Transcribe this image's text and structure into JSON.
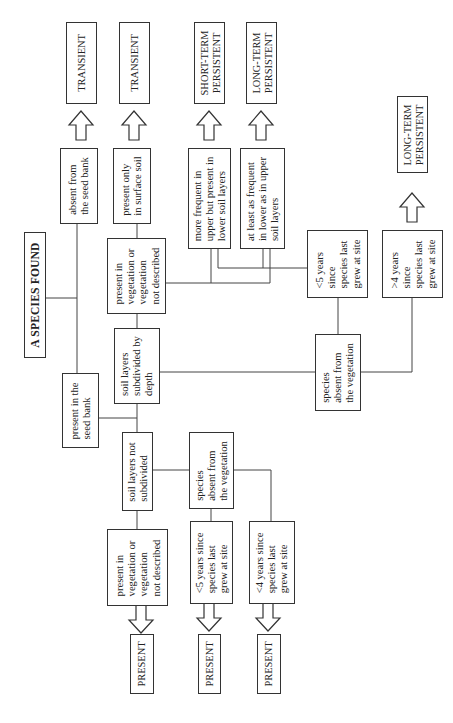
{
  "title": "A SPECIES FOUND",
  "nodes": {
    "absent_seed_bank": "absent from\nthe seed bank",
    "present_seed_bank": "present in the\nseed bank",
    "present_surface_soil": "present only\nin surface soil",
    "present_in_vegetation_subdivided": "present in\nvegetation or\nvegetation\nnot described",
    "soil_subdivided": "soil layers\nsubdivided by\ndepth",
    "soil_not_subdivided": "soil layers not\nsubdivided",
    "present_in_vegetation_not_subdivided": "present in\nvegetation or\nvegetation\nnot described",
    "more_frequent_upper": "more frequent in\nupper but present in\nlower soil layers",
    "at_least_as_frequent_lower": "at least as frequent\nin lower as in upper\nsoil layers",
    "species_absent_vegetation_subdivided": "species\nabsent from\nthe vegetation",
    "lt5_years_subdivided": "<5 years\nsince\nspecies last\ngrew at site",
    "gt4_years_subdivided": ">4 years\nsince\nspecies last\ngrew at site",
    "species_absent_vegetation_not_subdivided": "species\nabsent from\nthe vegetation",
    "lt5_years_not_subdivided": "<5 years since\nspecies last\ngrew at site",
    "lt4_years_not_subdivided": "<4 years since\nspecies last\ngrew at site"
  },
  "outcomes": {
    "transient_1": "TRANSIENT",
    "transient_2": "TRANSIENT",
    "short_term_persistent": "SHORT-TERM\nPERSISTENT",
    "long_term_persistent_1": "LONG-TERM\nPERSISTENT",
    "long_term_persistent_2": "LONG-TERM\nPERSISTENT",
    "present_1": "PRESENT",
    "present_2": "PRESENT",
    "present_3": "PRESENT"
  }
}
